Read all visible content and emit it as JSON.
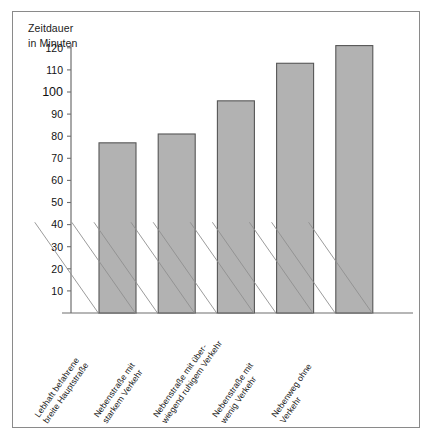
{
  "figure": {
    "axis_title_line1": "Zeitdauer",
    "axis_title_line2": "in Minuten",
    "frame_color": "#8a8a8a",
    "bar_fill": "#b2b2b2",
    "bar_stroke": "#565656",
    "axis_color": "#6e6e6e"
  },
  "chart_data": {
    "type": "bar",
    "title": "Zeitdauer in Minuten",
    "xlabel": "",
    "ylabel": "Zeitdauer in Minuten",
    "ylim": [
      0,
      125
    ],
    "grid": false,
    "legend": "none",
    "yticks": [
      10,
      20,
      30,
      40,
      50,
      60,
      70,
      80,
      90,
      100,
      110,
      120
    ],
    "ytick_labels": [
      "10",
      "20",
      "30",
      "40",
      "50",
      "60",
      "70",
      "80",
      "90",
      "100",
      "110",
      "120"
    ],
    "categories": [
      "Lebhaft befahrene breite Hauptstraße",
      "Nebenstraße mit starkem Verkehr",
      "Nebenstraße mit überwiegend ruhigem Verkehr",
      "Nebenstraße mit wenig Verkehr",
      "Nebenweg ohne Verkehr"
    ],
    "category_lines": [
      [
        "Lebhaft befahrene",
        "breite Hauptstraße"
      ],
      [
        "Nebenstraße mit",
        "starkem Verkehr"
      ],
      [
        "Nebenstraße mit über-",
        "wiegend ruhigem Verkehr"
      ],
      [
        "Nebenstraße mit",
        "wenig Verkehr"
      ],
      [
        "Nebenweg ohne",
        "Verkehr"
      ]
    ],
    "values": [
      77,
      81,
      96,
      113,
      121
    ],
    "series": [
      {
        "name": "Zeitdauer in Minuten",
        "values": [
          77,
          81,
          96,
          113,
          121
        ]
      }
    ]
  }
}
